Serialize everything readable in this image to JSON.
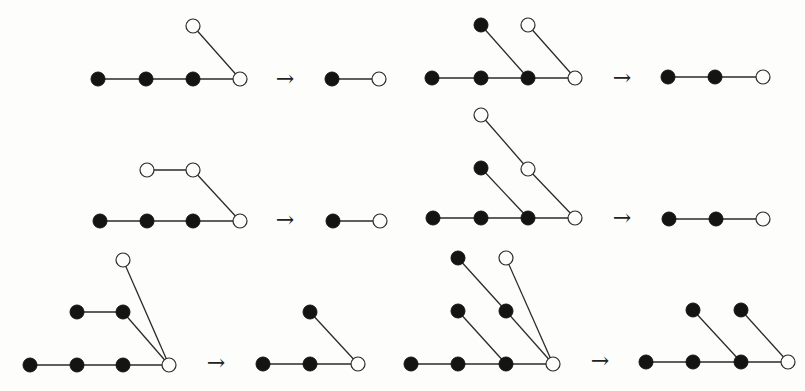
{
  "figure": {
    "arrow_glyph": "→",
    "node_radius": 7,
    "colors": {
      "edge": "#2a2a2a",
      "filled": "#141414",
      "open_fill": "#fdfdfb",
      "background": "#fdfdfb"
    },
    "transitions": [
      {
        "id": "r1-left",
        "arrow": {
          "x": 285,
          "y": 80
        },
        "before": {
          "nodes": [
            {
              "x": 98,
              "y": 79,
              "type": "filled"
            },
            {
              "x": 146,
              "y": 79,
              "type": "filled"
            },
            {
              "x": 193,
              "y": 79,
              "type": "filled"
            },
            {
              "x": 240,
              "y": 79,
              "type": "open"
            },
            {
              "x": 193,
              "y": 26,
              "type": "open"
            }
          ],
          "edges": [
            [
              0,
              1
            ],
            [
              1,
              2
            ],
            [
              2,
              3
            ],
            [
              4,
              3
            ]
          ]
        },
        "after": {
          "nodes": [
            {
              "x": 332,
              "y": 79,
              "type": "filled"
            },
            {
              "x": 379,
              "y": 79,
              "type": "open"
            }
          ],
          "edges": [
            [
              0,
              1
            ]
          ]
        }
      },
      {
        "id": "r1-right",
        "arrow": {
          "x": 622,
          "y": 79
        },
        "before": {
          "nodes": [
            {
              "x": 432,
              "y": 78,
              "type": "filled"
            },
            {
              "x": 481,
              "y": 78,
              "type": "filled"
            },
            {
              "x": 528,
              "y": 78,
              "type": "filled"
            },
            {
              "x": 575,
              "y": 78,
              "type": "open"
            },
            {
              "x": 481,
              "y": 25,
              "type": "filled"
            },
            {
              "x": 528,
              "y": 25,
              "type": "open"
            }
          ],
          "edges": [
            [
              0,
              1
            ],
            [
              1,
              2
            ],
            [
              2,
              3
            ],
            [
              4,
              2
            ],
            [
              5,
              3
            ]
          ]
        },
        "after": {
          "nodes": [
            {
              "x": 668,
              "y": 77,
              "type": "filled"
            },
            {
              "x": 715,
              "y": 77,
              "type": "filled"
            },
            {
              "x": 763,
              "y": 77,
              "type": "open"
            }
          ],
          "edges": [
            [
              0,
              1
            ],
            [
              1,
              2
            ]
          ]
        }
      },
      {
        "id": "r2-left",
        "arrow": {
          "x": 285,
          "y": 221
        },
        "before": {
          "nodes": [
            {
              "x": 100,
              "y": 221,
              "type": "filled"
            },
            {
              "x": 147,
              "y": 221,
              "type": "filled"
            },
            {
              "x": 193,
              "y": 221,
              "type": "filled"
            },
            {
              "x": 240,
              "y": 221,
              "type": "open"
            },
            {
              "x": 147,
              "y": 170,
              "type": "open"
            },
            {
              "x": 193,
              "y": 170,
              "type": "open"
            }
          ],
          "edges": [
            [
              0,
              1
            ],
            [
              1,
              2
            ],
            [
              2,
              3
            ],
            [
              4,
              5
            ],
            [
              5,
              3
            ]
          ]
        },
        "after": {
          "nodes": [
            {
              "x": 333,
              "y": 221,
              "type": "filled"
            },
            {
              "x": 380,
              "y": 221,
              "type": "open"
            }
          ],
          "edges": [
            [
              0,
              1
            ]
          ]
        }
      },
      {
        "id": "r2-right",
        "arrow": {
          "x": 622,
          "y": 219
        },
        "before": {
          "nodes": [
            {
              "x": 433,
              "y": 218,
              "type": "filled"
            },
            {
              "x": 481,
              "y": 218,
              "type": "filled"
            },
            {
              "x": 528,
              "y": 218,
              "type": "filled"
            },
            {
              "x": 575,
              "y": 218,
              "type": "open"
            },
            {
              "x": 481,
              "y": 168,
              "type": "filled"
            },
            {
              "x": 528,
              "y": 169,
              "type": "open"
            },
            {
              "x": 481,
              "y": 115,
              "type": "open"
            }
          ],
          "edges": [
            [
              0,
              1
            ],
            [
              1,
              2
            ],
            [
              2,
              3
            ],
            [
              4,
              2
            ],
            [
              6,
              5
            ],
            [
              5,
              3
            ]
          ]
        },
        "after": {
          "nodes": [
            {
              "x": 669,
              "y": 219,
              "type": "filled"
            },
            {
              "x": 716,
              "y": 219,
              "type": "filled"
            },
            {
              "x": 763,
              "y": 219,
              "type": "open"
            }
          ],
          "edges": [
            [
              0,
              1
            ],
            [
              1,
              2
            ]
          ]
        }
      },
      {
        "id": "r3-left",
        "arrow": {
          "x": 216,
          "y": 364
        },
        "before": {
          "nodes": [
            {
              "x": 30,
              "y": 365,
              "type": "filled"
            },
            {
              "x": 77,
              "y": 365,
              "type": "filled"
            },
            {
              "x": 123,
              "y": 365,
              "type": "filled"
            },
            {
              "x": 169,
              "y": 365,
              "type": "open"
            },
            {
              "x": 77,
              "y": 312,
              "type": "filled"
            },
            {
              "x": 123,
              "y": 312,
              "type": "filled"
            },
            {
              "x": 123,
              "y": 260,
              "type": "open"
            }
          ],
          "edges": [
            [
              0,
              1
            ],
            [
              1,
              2
            ],
            [
              2,
              3
            ],
            [
              4,
              5
            ],
            [
              5,
              3
            ],
            [
              6,
              3
            ]
          ]
        },
        "after": {
          "nodes": [
            {
              "x": 263,
              "y": 364,
              "type": "filled"
            },
            {
              "x": 310,
              "y": 364,
              "type": "filled"
            },
            {
              "x": 358,
              "y": 364,
              "type": "open"
            },
            {
              "x": 310,
              "y": 312,
              "type": "filled"
            }
          ],
          "edges": [
            [
              0,
              1
            ],
            [
              1,
              2
            ],
            [
              3,
              2
            ]
          ]
        }
      },
      {
        "id": "r3-right",
        "arrow": {
          "x": 600,
          "y": 362
        },
        "before": {
          "nodes": [
            {
              "x": 411,
              "y": 364,
              "type": "filled"
            },
            {
              "x": 458,
              "y": 364,
              "type": "filled"
            },
            {
              "x": 506,
              "y": 364,
              "type": "filled"
            },
            {
              "x": 553,
              "y": 364,
              "type": "open"
            },
            {
              "x": 458,
              "y": 311,
              "type": "filled"
            },
            {
              "x": 506,
              "y": 311,
              "type": "filled"
            },
            {
              "x": 458,
              "y": 258,
              "type": "filled"
            },
            {
              "x": 506,
              "y": 258,
              "type": "open"
            }
          ],
          "edges": [
            [
              0,
              1
            ],
            [
              1,
              2
            ],
            [
              2,
              3
            ],
            [
              4,
              2
            ],
            [
              6,
              5
            ],
            [
              5,
              3
            ],
            [
              7,
              3
            ]
          ]
        },
        "after": {
          "nodes": [
            {
              "x": 646,
              "y": 362,
              "type": "filled"
            },
            {
              "x": 693,
              "y": 362,
              "type": "filled"
            },
            {
              "x": 741,
              "y": 362,
              "type": "filled"
            },
            {
              "x": 788,
              "y": 362,
              "type": "open"
            },
            {
              "x": 693,
              "y": 310,
              "type": "filled"
            },
            {
              "x": 741,
              "y": 310,
              "type": "filled"
            }
          ],
          "edges": [
            [
              0,
              1
            ],
            [
              1,
              2
            ],
            [
              2,
              3
            ],
            [
              4,
              2
            ],
            [
              5,
              3
            ]
          ]
        }
      }
    ]
  }
}
